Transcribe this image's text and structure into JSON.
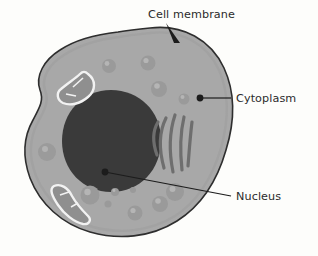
{
  "diagram": {
    "kind": "animal-cell-cross-section",
    "background_color": "#fdfdfb"
  },
  "labels": {
    "cell_membrane": "Cell membrane",
    "cytoplasm": "Cytoplasm",
    "nucleus": "Nucleus"
  },
  "colors": {
    "background": "#fdfdfb",
    "cytoplasm_fill": "#a8a8a8",
    "membrane_stroke": "#2e2e2e",
    "nucleus_fill": "#3a3a3a",
    "organelle_dark": "#6e6e6e",
    "vesicle_fill": "#9a9a9a",
    "vesicle_highlight": "#b4b4b4",
    "mitochondria_outline": "#f2f2f2",
    "mitochondria_fill": "#8f8f8f",
    "leader_line": "#1c1c1c",
    "text": "#2b2b2b"
  },
  "structures": {
    "nucleus": {
      "name": "Nucleus",
      "cx": 111,
      "cy": 141,
      "rx": 49,
      "ry": 51
    },
    "mitochondria": [
      {
        "name": "mitochondrion-upper-left",
        "cx": 74,
        "cy": 90
      },
      {
        "name": "mitochondrion-lower-left",
        "cx": 68,
        "cy": 200
      }
    ],
    "endoplasmic_reticulum": {
      "name": "endoplasmic-reticulum",
      "strand_count": 5,
      "cx": 172,
      "cy": 145
    },
    "vesicles": [
      {
        "cx": 109,
        "cy": 66,
        "r": 7
      },
      {
        "cx": 148,
        "cy": 63,
        "r": 7.5
      },
      {
        "cx": 159,
        "cy": 89,
        "r": 8
      },
      {
        "cx": 184,
        "cy": 99,
        "r": 5.5
      },
      {
        "cx": 47,
        "cy": 152,
        "r": 9
      },
      {
        "cx": 90,
        "cy": 195,
        "r": 9.5
      },
      {
        "cx": 115,
        "cy": 192,
        "r": 4
      },
      {
        "cx": 108,
        "cy": 204,
        "r": 3.5
      },
      {
        "cx": 135,
        "cy": 213,
        "r": 7.5
      },
      {
        "cx": 133,
        "cy": 190,
        "r": 3
      },
      {
        "cx": 160,
        "cy": 204,
        "r": 8
      },
      {
        "cx": 175,
        "cy": 192,
        "r": 9
      }
    ]
  },
  "leaders": {
    "cell_membrane": {
      "text_x": 148,
      "text_y": 18,
      "tip_x": 178,
      "tip_y": 42,
      "start_x": 166,
      "start_y": 23
    },
    "cytoplasm": {
      "text_x": 236,
      "text_y": 102,
      "dot_x": 200,
      "dot_y": 98,
      "line_end_x": 231,
      "line_end_y": 98
    },
    "nucleus": {
      "text_x": 236,
      "text_y": 200,
      "dot_x": 105,
      "dot_y": 172,
      "line_end_x": 231,
      "line_end_y": 196
    }
  }
}
